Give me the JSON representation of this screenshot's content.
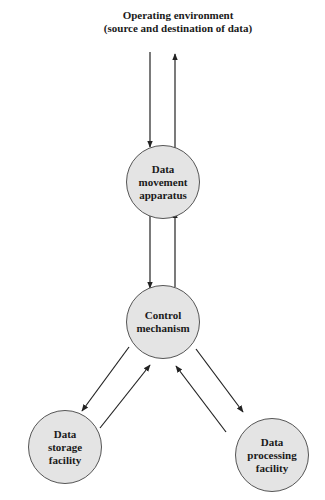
{
  "diagram": {
    "environment": {
      "line1": "Operating environment",
      "line2": "(source and destination of data)"
    },
    "nodes": {
      "data_movement": "Data\nmovement\napparatus",
      "control": "Control\nmechanism",
      "storage": "Data\nstorage\nfacility",
      "processing": "Data\nprocessing\nfacility"
    },
    "edges": [
      {
        "from": "environment",
        "to": "data_movement"
      },
      {
        "from": "data_movement",
        "to": "environment"
      },
      {
        "from": "data_movement",
        "to": "control"
      },
      {
        "from": "control",
        "to": "data_movement"
      },
      {
        "from": "control",
        "to": "storage"
      },
      {
        "from": "storage",
        "to": "control"
      },
      {
        "from": "control",
        "to": "processing"
      },
      {
        "from": "processing",
        "to": "control"
      }
    ],
    "colors": {
      "node_fill": "#e4e4e4",
      "node_stroke": "#555555",
      "arrow": "#222222"
    }
  }
}
